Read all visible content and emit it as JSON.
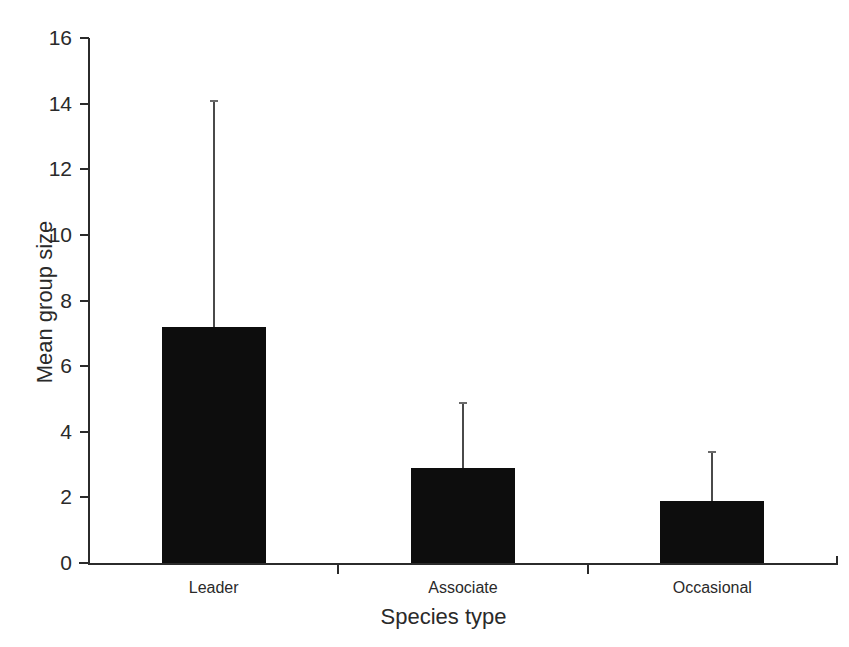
{
  "chart_data": {
    "type": "bar",
    "title": "",
    "subtitle": "",
    "xlabel": "Species type",
    "ylabel": "Mean group size",
    "categories": [
      "Leader",
      "Associate",
      "Occasional"
    ],
    "values": [
      7.2,
      2.9,
      1.9
    ],
    "error_upper": [
      14.1,
      4.9,
      3.4
    ],
    "error_bars": "upper only (one-sided whisker, small cap)",
    "ylim": [
      0,
      16
    ],
    "yticks": [
      0,
      2,
      4,
      6,
      8,
      10,
      12,
      14,
      16
    ],
    "ytick_labels": [
      "0",
      "2",
      "4",
      "6",
      "8",
      "10",
      "12",
      "14",
      "16"
    ],
    "grid": false,
    "legend": "none",
    "bar_color": "#0d0d0d",
    "axis_color": "#2b2b2b",
    "background_color": "#ffffff",
    "series": [
      {
        "name": "Mean group size",
        "values": [
          7.2,
          2.9,
          1.9
        ],
        "error_upper": [
          14.1,
          4.9,
          3.4
        ]
      }
    ],
    "points": [
      {
        "category": "Leader",
        "mean": 7.2,
        "upper_whisker": 14.1
      },
      {
        "category": "Associate",
        "mean": 2.9,
        "upper_whisker": 4.9
      },
      {
        "category": "Occasional",
        "mean": 1.9,
        "upper_whisker": 3.4
      }
    ]
  }
}
